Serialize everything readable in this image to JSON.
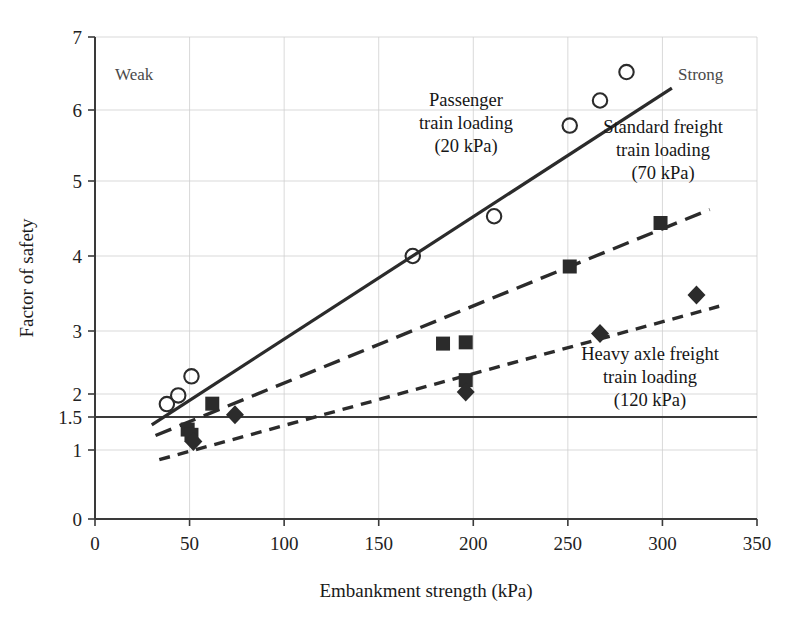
{
  "chart_data": {
    "type": "scatter",
    "title": "",
    "xlabel": "Embankment strength (kPa)",
    "ylabel": "Factor of safety",
    "xlim": [
      0,
      350
    ],
    "ylim": [
      0,
      7
    ],
    "grid": true,
    "legend_position": "inline-annotations",
    "xticks": [
      0,
      50,
      100,
      150,
      200,
      250,
      300,
      350
    ],
    "xtick_labels": [
      "0",
      "50",
      "100",
      "150",
      "200",
      "250",
      "300",
      "350"
    ],
    "yticks": [
      0,
      1,
      1.5,
      2,
      3,
      4,
      5,
      6,
      7
    ],
    "ytick_labels": [
      "0",
      "1",
      "1.5",
      "2",
      "3",
      "4",
      "5",
      "6",
      "7"
    ],
    "reference_lines": [
      {
        "name": "factor-of-safety-threshold",
        "axis": "y",
        "value": 1.5,
        "style": "solid"
      }
    ],
    "corner_labels": {
      "left": "Weak",
      "right": "Strong"
    },
    "series": [
      {
        "name": "Passenger train loading (20 kPa)",
        "marker": "open-circle",
        "trendline_style": "solid",
        "points": [
          {
            "x": 38,
            "y": 1.78
          },
          {
            "x": 44,
            "y": 1.97
          },
          {
            "x": 51,
            "y": 2.28
          },
          {
            "x": 168,
            "y": 4.0
          },
          {
            "x": 211,
            "y": 4.53
          },
          {
            "x": 251,
            "y": 5.78
          },
          {
            "x": 267,
            "y": 6.13
          },
          {
            "x": 281,
            "y": 6.52
          }
        ],
        "trendline": {
          "x0": 30,
          "y0": 1.38,
          "x1": 305,
          "y1": 6.3
        }
      },
      {
        "name": "Standard freight train loading (70 kPa)",
        "marker": "filled-square",
        "trendline_style": "long-dash",
        "points": [
          {
            "x": 49,
            "y": 1.31
          },
          {
            "x": 51,
            "y": 1.23
          },
          {
            "x": 62,
            "y": 1.79
          },
          {
            "x": 184,
            "y": 2.8
          },
          {
            "x": 196,
            "y": 2.82
          },
          {
            "x": 196,
            "y": 2.22
          },
          {
            "x": 251,
            "y": 3.86
          },
          {
            "x": 299,
            "y": 4.44
          }
        ],
        "trendline": {
          "x0": 32,
          "y0": 1.22,
          "x1": 325,
          "y1": 4.62
        }
      },
      {
        "name": "Heavy axle freight train loading (120 kPa)",
        "marker": "filled-diamond",
        "trendline_style": "short-dash",
        "points": [
          {
            "x": 52,
            "y": 1.13
          },
          {
            "x": 74,
            "y": 1.55
          },
          {
            "x": 196,
            "y": 2.03
          },
          {
            "x": 267,
            "y": 2.96
          },
          {
            "x": 318,
            "y": 3.48
          }
        ],
        "trendline": {
          "x0": 34,
          "y0": 0.86,
          "x1": 330,
          "y1": 3.33
        }
      }
    ],
    "annotations": [
      {
        "name": "passenger-annotation",
        "lines": [
          "Passenger",
          "train loading",
          "(20 kPa)"
        ]
      },
      {
        "name": "standard-freight-annotation",
        "lines": [
          "Standard freight",
          "train loading",
          "(70 kPa)"
        ]
      },
      {
        "name": "heavy-axle-annotation",
        "lines": [
          "Heavy axle freight",
          "train loading",
          "(120 kPa)"
        ]
      }
    ],
    "colors": {
      "ink": "#2b2b2b",
      "grid": "#cfcfcf",
      "muted": "#4a4a4a"
    }
  }
}
